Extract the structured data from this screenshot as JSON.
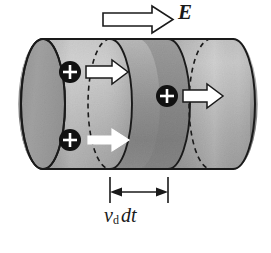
{
  "figure": {
    "type": "physics-diagram",
    "background_color": "#ffffff",
    "ink_color": "#1a1a1a"
  },
  "field_arrow": {
    "icon": "block-arrow-right-icon",
    "label": "E",
    "description": "hollow outlined block arrow pointing right, labelled E",
    "fill": "#ffffff",
    "stroke": "#1a1a1a"
  },
  "cylinder": {
    "name": "conductor-cylinder",
    "left_cap_fill": "#9a9a9a",
    "body_fill_light": "#d8d8d8",
    "body_fill_mid": "#a8a8a8",
    "body_fill_dark": "#4a4a4a",
    "stroke": "#1a1a1a",
    "description": "horizontal shaded cylinder with elliptical left end cap"
  },
  "slab": {
    "name": "drift-slab",
    "description": "dark shaded slab of length v_d dt between two cross-sections",
    "fill_dark": "#3c3c3c"
  },
  "charges": [
    {
      "id": "charge-upper-left",
      "icon": "plus-charge-icon",
      "symbol": "+",
      "cx": 70,
      "cy": 72,
      "r": 11
    },
    {
      "id": "charge-lower-left",
      "icon": "plus-charge-icon",
      "symbol": "+",
      "cx": 70,
      "cy": 140,
      "r": 11
    },
    {
      "id": "charge-right",
      "icon": "plus-charge-icon",
      "symbol": "+",
      "cx": 167,
      "cy": 96,
      "r": 11
    }
  ],
  "drift_arrows": [
    {
      "id": "drift-arrow-upper-left",
      "icon": "arrow-right-icon",
      "style": "hollow"
    },
    {
      "id": "drift-arrow-lower-left",
      "icon": "arrow-right-icon",
      "style": "solid-white"
    },
    {
      "id": "drift-arrow-right",
      "icon": "arrow-right-icon",
      "style": "hollow"
    }
  ],
  "dimension": {
    "name": "drift-length-dimension",
    "label_v": "v",
    "label_sub": "d",
    "label_dt": "dt",
    "full_label": "v_d dt",
    "arrow_style": "double-headed",
    "extension_ticks": 2
  },
  "dashed_edges": {
    "description": "dashed ellipse arcs mark hidden back edges of cross-sections",
    "dash_pattern": "5 4"
  }
}
